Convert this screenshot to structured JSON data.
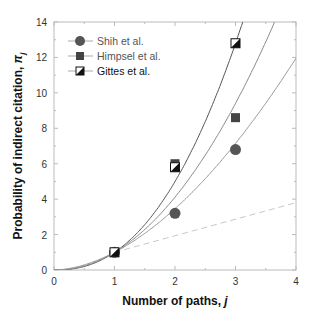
{
  "chart_data": {
    "type": "scatter",
    "title": "",
    "xlabel": "Number of  paths, j",
    "ylabel": "Probability of  indirect citation, π",
    "ylabel_subscript": "j",
    "xlim": [
      0,
      4
    ],
    "ylim": [
      0,
      14
    ],
    "x_ticks": [
      0,
      1,
      2,
      3,
      4
    ],
    "y_ticks": [
      0,
      2,
      4,
      6,
      8,
      10,
      12,
      14
    ],
    "grid": false,
    "legend_position": "upper left",
    "x": [
      1,
      2,
      3
    ],
    "series": [
      {
        "name": "Shih et al.",
        "marker": "circle",
        "color": "#555555",
        "values": [
          1.0,
          3.2,
          6.8
        ]
      },
      {
        "name": "Himpsel et al.",
        "marker": "square",
        "color": "#444444",
        "values": [
          1.0,
          6.0,
          8.6
        ]
      },
      {
        "name": "Gittes et al.",
        "marker": "half-filled-square",
        "color": "#111111",
        "values": [
          1.0,
          5.8,
          12.8
        ]
      }
    ],
    "fit_curves": [
      {
        "name": "fit-gittes",
        "form": "j^2.32",
        "color": "#444444",
        "style": "solid"
      },
      {
        "name": "fit-himpsel",
        "form": "j^2.04",
        "color": "#777777",
        "style": "solid"
      },
      {
        "name": "fit-shih",
        "form": "j^1.79",
        "color": "#888888",
        "style": "solid"
      },
      {
        "name": "linear-reference",
        "points": [
          [
            1,
            1.0
          ],
          [
            4,
            3.8
          ]
        ],
        "color": "#bbbbbb",
        "style": "dashed"
      }
    ]
  },
  "legend": {
    "items": [
      {
        "label": "Shih et al."
      },
      {
        "label": "Himpsel et al."
      },
      {
        "label": "Gittes et al."
      }
    ]
  },
  "axes": {
    "x_title": "Number of  paths, ",
    "x_title_var": "j",
    "y_title": "Probability of  indirect citation, ",
    "y_title_var": "π",
    "y_title_sub": "j",
    "x_tick_labels": [
      "0",
      "1",
      "2",
      "3",
      "4"
    ],
    "y_tick_labels": [
      "0",
      "2",
      "4",
      "6",
      "8",
      "10",
      "12",
      "14"
    ]
  }
}
